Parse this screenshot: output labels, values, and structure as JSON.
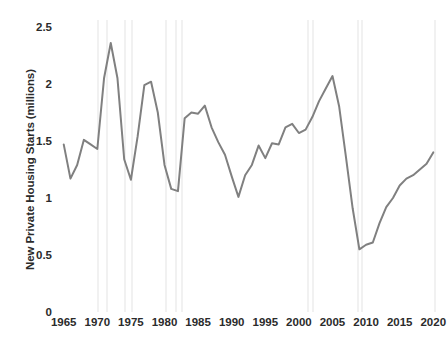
{
  "chart_data": {
    "type": "line",
    "title": "",
    "xlabel": "",
    "ylabel": "New Private Housing Starts (millions)",
    "xlim": [
      1964,
      2021
    ],
    "ylim": [
      0,
      2.5
    ],
    "grid": false,
    "legend": "none",
    "line_color": "#808080",
    "line_width": 2,
    "band_color": "#f1f1f1",
    "text_color": "#2b2b2b",
    "y_ticks": [
      "2.5",
      "2",
      "1.5",
      "1",
      "0.5",
      "0"
    ],
    "y_tick_values": [
      2.5,
      2,
      1.5,
      1,
      0.5,
      0
    ],
    "x_ticks": [
      "1965",
      "1970",
      "1975",
      "1980",
      "1985",
      "1990",
      "1995",
      "2000",
      "2005",
      "2010",
      "2015",
      "2020"
    ],
    "x_tick_values": [
      1965,
      1970,
      1975,
      1980,
      1985,
      1990,
      1995,
      2000,
      2005,
      2010,
      2015,
      2020
    ],
    "x": [
      1965,
      1966,
      1967,
      1968,
      1969,
      1970,
      1971,
      1972,
      1973,
      1974,
      1975,
      1976,
      1977,
      1978,
      1979,
      1980,
      1981,
      1982,
      1983,
      1984,
      1985,
      1986,
      1987,
      1988,
      1989,
      1990,
      1991,
      1992,
      1993,
      1994,
      1995,
      1996,
      1997,
      1998,
      1999,
      2000,
      2001,
      2002,
      2003,
      2004,
      2005,
      2006,
      2007,
      2008,
      2009,
      2010,
      2011,
      2012,
      2013,
      2014,
      2015,
      2016,
      2017,
      2018,
      2019,
      2020
    ],
    "values": [
      1.47,
      1.17,
      1.29,
      1.51,
      1.47,
      1.43,
      2.05,
      2.36,
      2.05,
      1.34,
      1.16,
      1.54,
      1.99,
      2.02,
      1.75,
      1.29,
      1.08,
      1.06,
      1.7,
      1.75,
      1.74,
      1.81,
      1.62,
      1.49,
      1.38,
      1.19,
      1.01,
      1.2,
      1.29,
      1.46,
      1.35,
      1.48,
      1.47,
      1.62,
      1.65,
      1.57,
      1.6,
      1.71,
      1.85,
      1.96,
      2.07,
      1.8,
      1.36,
      0.91,
      0.55,
      0.59,
      0.61,
      0.78,
      0.92,
      1.0,
      1.11,
      1.17,
      1.2,
      1.25,
      1.3,
      1.4
    ],
    "series": [
      {
        "name": "New Private Housing Starts (millions)",
        "values": [
          1.47,
          1.17,
          1.29,
          1.51,
          1.47,
          1.43,
          2.05,
          2.36,
          2.05,
          1.34,
          1.16,
          1.54,
          1.99,
          2.02,
          1.75,
          1.29,
          1.08,
          1.06,
          1.7,
          1.75,
          1.74,
          1.81,
          1.62,
          1.49,
          1.38,
          1.19,
          1.01,
          1.2,
          1.29,
          1.46,
          1.35,
          1.48,
          1.47,
          1.62,
          1.65,
          1.57,
          1.6,
          1.71,
          1.85,
          1.96,
          2.07,
          1.8,
          1.36,
          0.91,
          0.55,
          0.59,
          0.61,
          0.78,
          0.92,
          1.0,
          1.11,
          1.17,
          1.2,
          1.25,
          1.3,
          1.4
        ]
      }
    ],
    "annotations": [],
    "shaded_bands": [
      {
        "name": "band-1970",
        "start": 1969.9,
        "end": 1970.3
      },
      {
        "name": "band-1971",
        "start": 1971.3,
        "end": 1971.6
      },
      {
        "name": "band-1974",
        "start": 1973.9,
        "end": 1974.2
      },
      {
        "name": "band-1975",
        "start": 1975.0,
        "end": 1975.3
      },
      {
        "name": "band-1980",
        "start": 1980.1,
        "end": 1980.4
      },
      {
        "name": "band-1981",
        "start": 1981.6,
        "end": 1981.9
      },
      {
        "name": "band-1982",
        "start": 1982.4,
        "end": 1982.7
      },
      {
        "name": "band-2001a",
        "start": 2001.2,
        "end": 2001.5
      },
      {
        "name": "band-2001b",
        "start": 2001.9,
        "end": 2002.2
      },
      {
        "name": "band-2008",
        "start": 2008.6,
        "end": 2008.9
      },
      {
        "name": "band-2009",
        "start": 2009.3,
        "end": 2009.6
      },
      {
        "name": "band-2020",
        "start": 2020.1,
        "end": 2020.4
      }
    ]
  }
}
